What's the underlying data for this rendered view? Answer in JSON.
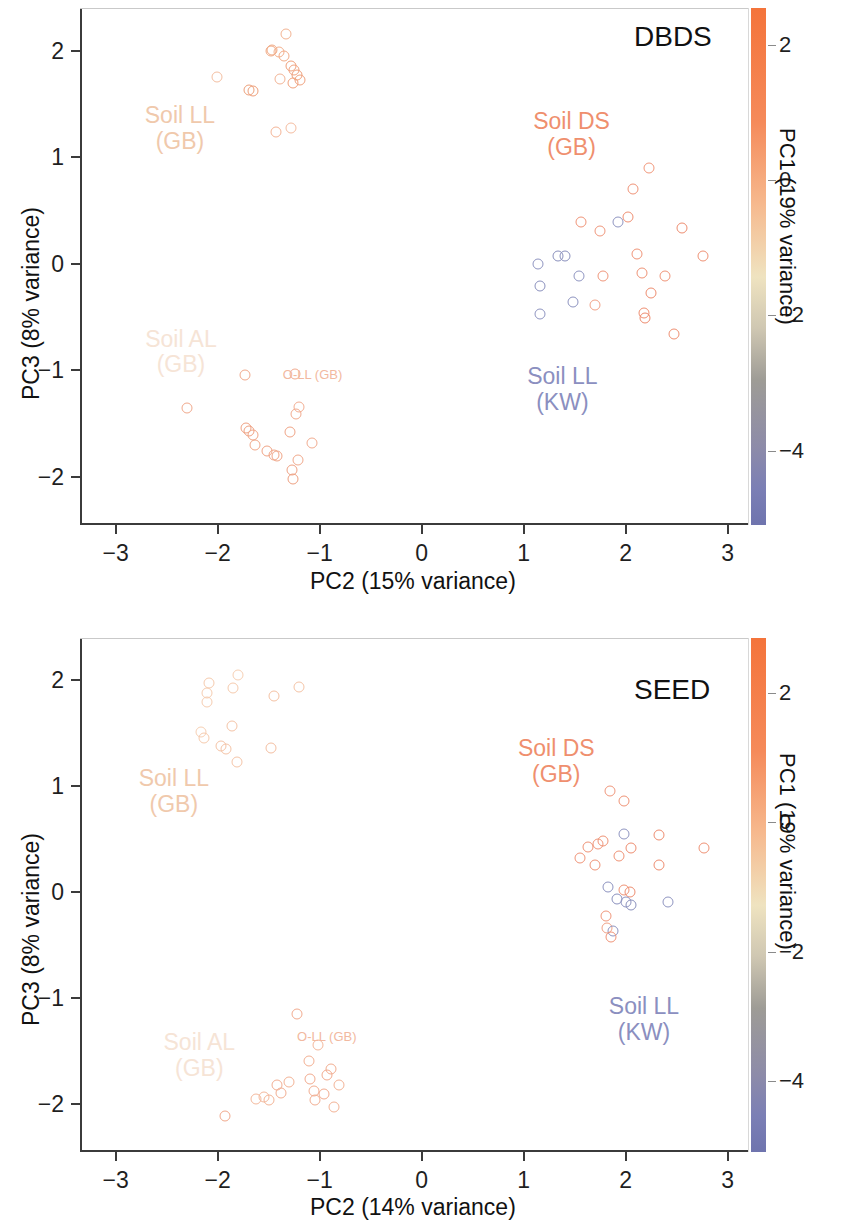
{
  "figure": {
    "background": "#ffffff",
    "marker_shape": "open-circle"
  },
  "palette": {
    "cb_top": "#f4743b",
    "cb_orange": "#f58a5a",
    "cb_cream": "#efe3c0",
    "cb_gray": "#9e9c96",
    "cb_blue": "#7b7fb5",
    "cb_bottom": "#6f74ae",
    "label_soil_ll_gb": "#f0c9ac",
    "label_soil_al_gb": "#f6e4d6",
    "label_soil_ds_gb": "#ef8f6e",
    "label_soil_ll_kw": "#8b8fc0",
    "label_o_ll_gb": "#f2b9a0",
    "axis": "#3b3b3b",
    "text": "#111111"
  },
  "chart_data": [
    {
      "type": "scatter",
      "title": "DBDS",
      "xlabel": "PC2 (15% variance)",
      "ylabel": "PC3 (8% variance)",
      "xlim": [
        -3.35,
        3.2
      ],
      "ylim": [
        -2.45,
        2.4
      ],
      "xticks": [
        -3,
        -2,
        -1,
        0,
        1,
        2,
        3
      ],
      "xticklabels": [
        "−3",
        "−2",
        "−1",
        "0",
        "1",
        "2",
        "3"
      ],
      "yticks": [
        -2,
        -1,
        0,
        1,
        2
      ],
      "yticklabels": [
        "−2",
        "−1",
        "0",
        "1",
        "2"
      ],
      "grid": false,
      "legend": "none",
      "colorbar": {
        "label": "PC1 (19% variance)",
        "ticks": [
          2,
          0,
          -2,
          -4
        ],
        "ticklabels": [
          "2",
          "0",
          "−2",
          "−4"
        ],
        "vmin": -5.1,
        "vmax": 2.55,
        "position": "right"
      },
      "annotations": [
        {
          "text": "Soil LL\n(GB)",
          "x": -2.37,
          "y": 1.37,
          "color": "#f0c9ac"
        },
        {
          "text": "Soil AL\n(GB)",
          "x": -2.36,
          "y": -0.73,
          "color": "#f6e4d6"
        },
        {
          "text": "Soil DS\n(GB)",
          "x": 1.47,
          "y": 1.31,
          "color": "#ef8f6e"
        },
        {
          "text": "Soil LL\n(KW)",
          "x": 1.38,
          "y": -1.08,
          "color": "#8b8fc0"
        },
        {
          "text": "O-LL (GB)",
          "x": -1.07,
          "y": -1.03,
          "color": "#f2b9a0"
        }
      ],
      "points": [
        {
          "x": -1.33,
          "y": 2.16,
          "c": "#f3b493"
        },
        {
          "x": -1.48,
          "y": 2.0,
          "c": "#f1a983"
        },
        {
          "x": -1.47,
          "y": 2.01,
          "c": "#f1a983"
        },
        {
          "x": -1.4,
          "y": 1.99,
          "c": "#f3b08d"
        },
        {
          "x": -1.35,
          "y": 1.95,
          "c": "#f2ac88"
        },
        {
          "x": -1.28,
          "y": 1.86,
          "c": "#f0a07b"
        },
        {
          "x": -1.25,
          "y": 1.82,
          "c": "#f1a482"
        },
        {
          "x": -1.22,
          "y": 1.77,
          "c": "#efa07c"
        },
        {
          "x": -1.19,
          "y": 1.72,
          "c": "#f0a37f"
        },
        {
          "x": -2.01,
          "y": 1.75,
          "c": "#f4bfa2"
        },
        {
          "x": -1.39,
          "y": 1.73,
          "c": "#f2b496"
        },
        {
          "x": -1.26,
          "y": 1.7,
          "c": "#f0a17c"
        },
        {
          "x": -1.69,
          "y": 1.63,
          "c": "#edA07a"
        },
        {
          "x": -1.65,
          "y": 1.62,
          "c": "#ee9f7a"
        },
        {
          "x": -1.43,
          "y": 1.24,
          "c": "#f4b597"
        },
        {
          "x": -1.28,
          "y": 1.27,
          "c": "#f5bda1"
        },
        {
          "x": 2.23,
          "y": 0.9,
          "c": "#f2987b"
        },
        {
          "x": 2.07,
          "y": 0.7,
          "c": "#f09377"
        },
        {
          "x": 1.56,
          "y": 0.39,
          "c": "#f09478"
        },
        {
          "x": 1.75,
          "y": 0.31,
          "c": "#f0977c"
        },
        {
          "x": 1.93,
          "y": 0.39,
          "c": "#8f95c1"
        },
        {
          "x": 2.02,
          "y": 0.44,
          "c": "#ef8f72"
        },
        {
          "x": 2.55,
          "y": 0.34,
          "c": "#ee8d70"
        },
        {
          "x": 2.76,
          "y": 0.07,
          "c": "#ef9275"
        },
        {
          "x": 2.11,
          "y": 0.09,
          "c": "#f09478"
        },
        {
          "x": 1.14,
          "y": 0.0,
          "c": "#8f95c1"
        },
        {
          "x": 1.34,
          "y": 0.07,
          "c": "#8a90bd"
        },
        {
          "x": 1.41,
          "y": 0.07,
          "c": "#8a90bd"
        },
        {
          "x": 1.54,
          "y": -0.11,
          "c": "#9096c2"
        },
        {
          "x": 1.78,
          "y": -0.11,
          "c": "#f0977c"
        },
        {
          "x": 2.16,
          "y": -0.09,
          "c": "#ef9376"
        },
        {
          "x": 2.39,
          "y": -0.11,
          "c": "#f09579"
        },
        {
          "x": 1.16,
          "y": -0.21,
          "c": "#8b91be"
        },
        {
          "x": 2.25,
          "y": -0.27,
          "c": "#ee8d70"
        },
        {
          "x": 1.48,
          "y": -0.36,
          "c": "#8d93c0"
        },
        {
          "x": 1.7,
          "y": -0.39,
          "c": "#f2a287"
        },
        {
          "x": 1.16,
          "y": -0.47,
          "c": "#8f95c1"
        },
        {
          "x": 2.18,
          "y": -0.46,
          "c": "#ef8f72"
        },
        {
          "x": 2.19,
          "y": -0.51,
          "c": "#ee8b6e"
        },
        {
          "x": 2.47,
          "y": -0.66,
          "c": "#ef9073"
        },
        {
          "x": -1.73,
          "y": -1.04,
          "c": "#f1a98c"
        },
        {
          "x": -1.24,
          "y": -1.03,
          "c": "#f2ab8f"
        },
        {
          "x": -2.3,
          "y": -1.35,
          "c": "#f1a98c"
        },
        {
          "x": -1.2,
          "y": -1.34,
          "c": "#f3ae92"
        },
        {
          "x": -1.72,
          "y": -1.54,
          "c": "#efa182"
        },
        {
          "x": -1.69,
          "y": -1.57,
          "c": "#efa182"
        },
        {
          "x": -1.65,
          "y": -1.61,
          "c": "#f0a586"
        },
        {
          "x": -1.23,
          "y": -1.41,
          "c": "#f2ab8f"
        },
        {
          "x": -1.29,
          "y": -1.58,
          "c": "#f0a486"
        },
        {
          "x": -1.63,
          "y": -1.7,
          "c": "#f1a889"
        },
        {
          "x": -1.52,
          "y": -1.76,
          "c": "#f0a486"
        },
        {
          "x": -1.45,
          "y": -1.79,
          "c": "#f0a587"
        },
        {
          "x": -1.42,
          "y": -1.8,
          "c": "#f0a587"
        },
        {
          "x": -1.08,
          "y": -1.68,
          "c": "#f2ac90"
        },
        {
          "x": -1.21,
          "y": -1.84,
          "c": "#f1a98c"
        },
        {
          "x": -1.27,
          "y": -1.93,
          "c": "#efa284"
        },
        {
          "x": -1.26,
          "y": -2.02,
          "c": "#eea081"
        }
      ]
    },
    {
      "type": "scatter",
      "title": "SEED",
      "xlabel": "PC2 (14% variance)",
      "ylabel": "PC3 (8% variance)",
      "xlim": [
        -3.35,
        3.2
      ],
      "ylim": [
        -2.45,
        2.4
      ],
      "xticks": [
        -3,
        -2,
        -1,
        0,
        1,
        2,
        3
      ],
      "xticklabels": [
        "−3",
        "−2",
        "−1",
        "0",
        "1",
        "2",
        "3"
      ],
      "yticks": [
        -2,
        -1,
        0,
        1,
        2
      ],
      "yticklabels": [
        "−2",
        "−1",
        "0",
        "1",
        "2"
      ],
      "grid": false,
      "legend": "none",
      "colorbar": {
        "label": "PC1 (19% variance)",
        "ticks": [
          2,
          0,
          -2,
          -4
        ],
        "ticklabels": [
          "2",
          "0",
          "−2",
          "−4"
        ],
        "vmin": -5.1,
        "vmax": 2.85,
        "position": "right"
      },
      "annotations": [
        {
          "text": "Soil LL\n(GB)",
          "x": -2.43,
          "y": 1.05,
          "color": "#f0c9ac"
        },
        {
          "text": "Soil AL\n(GB)",
          "x": -2.18,
          "y": -1.44,
          "color": "#f6e4d6"
        },
        {
          "text": "Soil DS\n(GB)",
          "x": 1.32,
          "y": 1.33,
          "color": "#ef8f6e"
        },
        {
          "text": "Soil LL\n(KW)",
          "x": 2.18,
          "y": -1.1,
          "color": "#8b8fc0"
        },
        {
          "text": "O-LL (GB)",
          "x": -0.93,
          "y": -1.36,
          "color": "#f2b9a0"
        }
      ],
      "points": [
        {
          "x": -1.8,
          "y": 2.05,
          "c": "#f7d0b4"
        },
        {
          "x": -2.09,
          "y": 1.98,
          "c": "#f6cbae"
        },
        {
          "x": -1.85,
          "y": 1.93,
          "c": "#f6cbae"
        },
        {
          "x": -1.2,
          "y": 1.94,
          "c": "#f5c4a6"
        },
        {
          "x": -2.1,
          "y": 1.88,
          "c": "#f6cdb1"
        },
        {
          "x": -2.1,
          "y": 1.8,
          "c": "#f6cdb1"
        },
        {
          "x": -1.45,
          "y": 1.85,
          "c": "#f5c2a4"
        },
        {
          "x": -1.86,
          "y": 1.57,
          "c": "#f5c4a7"
        },
        {
          "x": -2.16,
          "y": 1.51,
          "c": "#f7d0b4"
        },
        {
          "x": -2.13,
          "y": 1.46,
          "c": "#f6cbae"
        },
        {
          "x": -1.97,
          "y": 1.38,
          "c": "#f5c4a7"
        },
        {
          "x": -1.92,
          "y": 1.35,
          "c": "#f5c4a7"
        },
        {
          "x": -1.48,
          "y": 1.36,
          "c": "#f4bfa2"
        },
        {
          "x": -1.81,
          "y": 1.23,
          "c": "#f5c5a8"
        },
        {
          "x": 1.85,
          "y": 0.96,
          "c": "#f0977c"
        },
        {
          "x": 1.98,
          "y": 0.86,
          "c": "#ef9376"
        },
        {
          "x": 1.98,
          "y": 0.55,
          "c": "#8f95c1"
        },
        {
          "x": 2.33,
          "y": 0.54,
          "c": "#ee8d70"
        },
        {
          "x": 1.73,
          "y": 0.46,
          "c": "#f0977c"
        },
        {
          "x": 1.78,
          "y": 0.48,
          "c": "#ef9376"
        },
        {
          "x": 1.63,
          "y": 0.43,
          "c": "#ef9376"
        },
        {
          "x": 2.05,
          "y": 0.42,
          "c": "#ee8d70"
        },
        {
          "x": 2.77,
          "y": 0.42,
          "c": "#ef9275"
        },
        {
          "x": 1.94,
          "y": 0.34,
          "c": "#ef9376"
        },
        {
          "x": 1.55,
          "y": 0.32,
          "c": "#f09478"
        },
        {
          "x": 1.7,
          "y": 0.26,
          "c": "#ef9376"
        },
        {
          "x": 2.33,
          "y": 0.26,
          "c": "#ee8d70"
        },
        {
          "x": 1.83,
          "y": 0.05,
          "c": "#8d93c0"
        },
        {
          "x": 1.98,
          "y": 0.02,
          "c": "#ef9376"
        },
        {
          "x": 2.04,
          "y": 0.0,
          "c": "#ee8d70"
        },
        {
          "x": 1.92,
          "y": -0.06,
          "c": "#8a90bd"
        },
        {
          "x": 2.0,
          "y": -0.09,
          "c": "#8f95c1"
        },
        {
          "x": 2.05,
          "y": -0.12,
          "c": "#8a90bd"
        },
        {
          "x": 2.42,
          "y": -0.09,
          "c": "#8f95c1"
        },
        {
          "x": 1.81,
          "y": -0.22,
          "c": "#f0977c"
        },
        {
          "x": 1.82,
          "y": -0.34,
          "c": "#f0a287"
        },
        {
          "x": 1.88,
          "y": -0.36,
          "c": "#8f95c1"
        },
        {
          "x": 1.86,
          "y": -0.42,
          "c": "#f09478"
        },
        {
          "x": -1.22,
          "y": -1.15,
          "c": "#f2ab8f"
        },
        {
          "x": -1.02,
          "y": -1.44,
          "c": "#f4b89c"
        },
        {
          "x": -1.1,
          "y": -1.59,
          "c": "#f3b093"
        },
        {
          "x": -0.89,
          "y": -1.67,
          "c": "#f2ad90"
        },
        {
          "x": -0.93,
          "y": -1.72,
          "c": "#f2ab8f"
        },
        {
          "x": -1.3,
          "y": -1.79,
          "c": "#f3b396"
        },
        {
          "x": -1.42,
          "y": -1.82,
          "c": "#f2ae92"
        },
        {
          "x": -1.09,
          "y": -1.76,
          "c": "#f2ab8f"
        },
        {
          "x": -0.81,
          "y": -1.82,
          "c": "#f3b396"
        },
        {
          "x": -1.38,
          "y": -1.89,
          "c": "#f2ae92"
        },
        {
          "x": -1.06,
          "y": -1.87,
          "c": "#f2ae92"
        },
        {
          "x": -0.96,
          "y": -1.9,
          "c": "#f2ab8f"
        },
        {
          "x": -1.55,
          "y": -1.93,
          "c": "#f4b99d"
        },
        {
          "x": -1.5,
          "y": -1.96,
          "c": "#f3b597"
        },
        {
          "x": -1.62,
          "y": -1.95,
          "c": "#f4b99d"
        },
        {
          "x": -1.05,
          "y": -1.96,
          "c": "#f2ae92"
        },
        {
          "x": -0.86,
          "y": -2.03,
          "c": "#f3b396"
        },
        {
          "x": -1.93,
          "y": -2.11,
          "c": "#f1a98c"
        }
      ]
    }
  ]
}
